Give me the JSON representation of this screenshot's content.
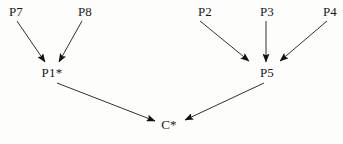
{
  "diagram": {
    "type": "directed-graph",
    "title": "",
    "background_color": "#fdfdfc",
    "line_color": "#1a1a1a",
    "text_color": "#1a1a1a",
    "nodes": [
      {
        "id": "P7",
        "label": "P7",
        "x": 16,
        "y": 12
      },
      {
        "id": "P8",
        "label": "P8",
        "x": 85,
        "y": 12
      },
      {
        "id": "P2",
        "label": "P2",
        "x": 205,
        "y": 12
      },
      {
        "id": "P3",
        "label": "P3",
        "x": 267,
        "y": 12
      },
      {
        "id": "P4",
        "label": "P4",
        "x": 330,
        "y": 12
      },
      {
        "id": "P1",
        "label": "P1*",
        "x": 52,
        "y": 73
      },
      {
        "id": "P5",
        "label": "P5",
        "x": 267,
        "y": 73
      },
      {
        "id": "C",
        "label": "C*",
        "x": 169,
        "y": 125
      }
    ],
    "edges": [
      {
        "id": "e-p7-p1",
        "from": "P7",
        "to": "P1",
        "x1": 17,
        "y1": 21,
        "x2": 45,
        "y2": 62
      },
      {
        "id": "e-p8-p1",
        "from": "P8",
        "to": "P1",
        "x1": 82,
        "y1": 21,
        "x2": 59,
        "y2": 62
      },
      {
        "id": "e-p2-p5",
        "from": "P2",
        "to": "P5",
        "x1": 200,
        "y1": 21,
        "x2": 249,
        "y2": 61
      },
      {
        "id": "e-p3-p5",
        "from": "P3",
        "to": "P5",
        "x1": 266,
        "y1": 21,
        "x2": 266,
        "y2": 62
      },
      {
        "id": "e-p4-p5",
        "from": "P4",
        "to": "P5",
        "x1": 327,
        "y1": 21,
        "x2": 280,
        "y2": 61
      },
      {
        "id": "e-p1-c",
        "from": "P1",
        "to": "C",
        "x1": 57,
        "y1": 83,
        "x2": 155,
        "y2": 121
      },
      {
        "id": "e-p5-c",
        "from": "P5",
        "to": "C",
        "x1": 264,
        "y1": 83,
        "x2": 185,
        "y2": 120
      }
    ]
  }
}
